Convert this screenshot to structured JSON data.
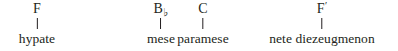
{
  "figure": {
    "type": "note-label-diagram",
    "background_color": "#ffffff",
    "text_color": "#231f20",
    "nodes": [
      {
        "pitch_letter": "F",
        "pitch_modifier": "",
        "pitch_full": "F",
        "name": "hypate",
        "center_x": 37
      },
      {
        "pitch_letter": "B",
        "pitch_modifier": "♭",
        "pitch_full": "B♭",
        "name": "mese",
        "center_x": 161
      },
      {
        "pitch_letter": "C",
        "pitch_modifier": "",
        "pitch_full": "C",
        "name": "paramese",
        "center_x": 203
      },
      {
        "pitch_letter": "F",
        "pitch_modifier": "′",
        "pitch_full": "F′",
        "name": "nete diezeugmenon",
        "center_x": 322
      }
    ]
  }
}
